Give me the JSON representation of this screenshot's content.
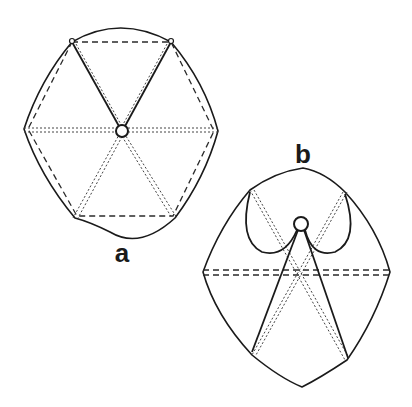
{
  "figure": {
    "panels": [
      {
        "id": "a",
        "label": "a",
        "description": "Hexagonal frame with six radial struts from central hub, viewed from top",
        "hub": {
          "x": 122,
          "y": 131
        },
        "vertices": [
          [
            72,
            42
          ],
          [
            171,
            42
          ],
          [
            218,
            131
          ],
          [
            175,
            218
          ],
          [
            75,
            218
          ],
          [
            24,
            129
          ]
        ]
      },
      {
        "id": "b",
        "label": "b",
        "description": "Folded hexagonal frame with two solid struts and looped arms from central hub",
        "hub": {
          "x": 301,
          "y": 224
        },
        "vertices": [
          [
            250,
            190
          ],
          [
            345,
            192
          ],
          [
            390,
            272
          ],
          [
            347,
            360
          ],
          [
            252,
            355
          ],
          [
            203,
            272
          ]
        ]
      }
    ]
  }
}
